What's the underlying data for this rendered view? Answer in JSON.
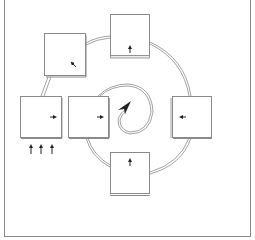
{
  "diagram": {
    "type": "cycle-diagram",
    "colors": {
      "background": "#ffffff",
      "frame": "#8a8a8a",
      "stroke": "#7a7a7a",
      "arrow": "#222222"
    },
    "panels": [
      {
        "id": "top-left",
        "x": 44,
        "y": 33,
        "w": 42,
        "h": 42,
        "mark": "arrow-up-left"
      },
      {
        "id": "top",
        "x": 110,
        "y": 14,
        "w": 40,
        "h": 42,
        "mark": "arrow-up"
      },
      {
        "id": "right",
        "x": 172,
        "y": 96,
        "w": 40,
        "h": 42,
        "mark": "arrow-left"
      },
      {
        "id": "bottom",
        "x": 110,
        "y": 152,
        "w": 40,
        "h": 42,
        "mark": "arrow-up"
      },
      {
        "id": "left-inner",
        "x": 68,
        "y": 96,
        "w": 41,
        "h": 42,
        "mark": "arrow-right"
      },
      {
        "id": "left-outer",
        "x": 20,
        "y": 96,
        "w": 42,
        "h": 42,
        "mark": "arrow-right"
      }
    ],
    "input_arrows": {
      "count": 3,
      "direction": "up",
      "below_panel": "left-outer"
    },
    "center": {
      "shape": "spiral-arrow"
    }
  }
}
